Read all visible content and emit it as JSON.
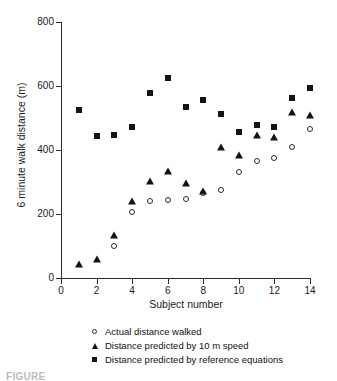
{
  "chart_data": {
    "type": "scatter",
    "title": "",
    "xlabel": "Subject number",
    "ylabel": "6 minute walk distance (m)",
    "xlim": [
      0,
      14
    ],
    "ylim": [
      0,
      800
    ],
    "xticks": [
      0,
      2,
      4,
      6,
      8,
      10,
      12,
      14
    ],
    "yticks": [
      0,
      200,
      400,
      600,
      800
    ],
    "grid": false,
    "legend_position": "below-axes",
    "x": [
      1,
      2,
      3,
      4,
      5,
      6,
      7,
      8,
      9,
      10,
      11,
      12,
      13,
      14
    ],
    "series": [
      {
        "name": "Actual distance walked",
        "marker": "open-circle",
        "color": "#2b2b2b",
        "values": [
          null,
          null,
          100,
          205,
          240,
          245,
          248,
          265,
          275,
          330,
          365,
          375,
          410,
          465
        ]
      },
      {
        "name": "Distance predicted by 10 m speed",
        "marker": "filled-triangle",
        "color": "#141414",
        "values": [
          45,
          60,
          135,
          240,
          303,
          335,
          298,
          272,
          408,
          385,
          447,
          440,
          520,
          510
        ]
      },
      {
        "name": "Distance predicted by reference equations",
        "marker": "filled-square",
        "color": "#141414",
        "values": [
          525,
          443,
          448,
          472,
          577,
          625,
          533,
          555,
          513,
          455,
          478,
          473,
          562,
          593
        ]
      }
    ]
  },
  "axes": {
    "y_tick_labels": [
      "800",
      "600",
      "400",
      "200",
      "0"
    ],
    "x_tick_labels": [
      "0",
      "2",
      "4",
      "6",
      "8",
      "10",
      "12",
      "14"
    ],
    "y_title": "6 minute walk distance (m)",
    "x_title": "Subject number"
  },
  "legend": {
    "items": [
      {
        "marker": "open-circle",
        "label": "Actual distance walked"
      },
      {
        "marker": "filled-triangle",
        "label": "Distance predicted by 10 m speed"
      },
      {
        "marker": "filled-square",
        "label": "Distance predicted by reference equations"
      }
    ]
  },
  "caption": {
    "text": "FIGURE"
  }
}
